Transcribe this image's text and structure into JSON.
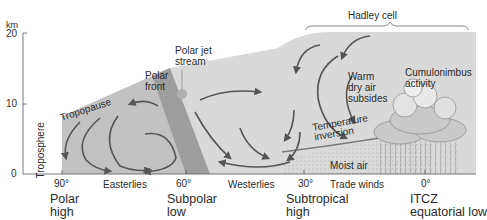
{
  "axis": {
    "unit": "km",
    "y_ticks": [
      "20",
      "10",
      "0"
    ]
  },
  "latitudes": [
    "90°",
    "60°",
    "30°",
    "0°"
  ],
  "wind_belts": [
    "Easterlies",
    "Westerlies",
    "Trade winds"
  ],
  "pressure_zones": [
    {
      "line1": "Polar",
      "line2": "high"
    },
    {
      "line1": "Subpolar",
      "line2": "low"
    },
    {
      "line1": "Subtropical",
      "line2": "high"
    },
    {
      "line1": "ITCZ",
      "line2": "equatorial low"
    }
  ],
  "labels": {
    "troposphere": "Troposphere",
    "tropopause": "Tropopause",
    "polar_front_1": "Polar",
    "polar_front_2": "front",
    "polar_jet_1": "Polar jet",
    "polar_jet_2": "stream",
    "hadley_cell": "Hadley cell",
    "warm_1": "Warm",
    "warm_2": "dry air",
    "warm_3": "subsides",
    "cumulo_1": "Cumulonimbus",
    "cumulo_2": "activity",
    "temp_inv_1": "Temperature",
    "temp_inv_2": "inversion",
    "moist_air": "Moist air"
  },
  "colors": {
    "atmosphere_fill": "#d9d9d9",
    "polar_cell_fill": "#c4c4c4",
    "polar_front_band": "#9e9e9e",
    "arrow": "#555555",
    "jet_stream": "#b3b3b3"
  }
}
